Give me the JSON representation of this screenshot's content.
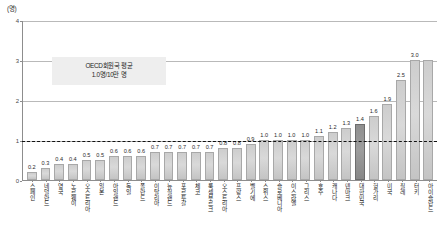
{
  "chart_data": {
    "type": "bar",
    "title": "",
    "unit_label": "(명)",
    "ylabel": "",
    "xlabel": "",
    "ylim": [
      0,
      4
    ],
    "yticks": [
      0,
      1,
      2,
      3,
      4
    ],
    "grid": true,
    "legend": "none",
    "highlight_category": "대한민국",
    "reference_line": {
      "value": 1.0,
      "style": "dashed",
      "label_line1": "OECD회원국 평균",
      "label_line2": "1.0명/10만 명"
    },
    "categories": [
      "스페인",
      "네덜란드",
      "영국",
      "노르웨이",
      "오스트리아",
      "일본",
      "아일랜드",
      "독일",
      "폴란드",
      "이탈리아",
      "뉴질랜드",
      "포르투갈",
      "체코",
      "룩셈부르크",
      "오스트리아",
      "프랑스",
      "벨기에",
      "스위스",
      "슬로베니아",
      "이스라엘",
      "그리스",
      "호주",
      "캐나다",
      "덴마크",
      "대한민국",
      "헝가리",
      "미국",
      "칠레",
      "터키",
      "아이슬란드"
    ],
    "values": [
      0.2,
      0.3,
      0.4,
      0.4,
      0.5,
      0.5,
      0.6,
      0.6,
      0.6,
      0.7,
      0.7,
      0.7,
      0.7,
      0.7,
      0.8,
      0.8,
      0.9,
      1.0,
      1.0,
      1.0,
      1.0,
      1.1,
      1.2,
      1.3,
      1.4,
      1.6,
      1.9,
      2.5,
      3.0,
      3.0
    ],
    "value_labels": [
      "0.2",
      "0.3",
      "0.4",
      "0.4",
      "0.5",
      "0.5",
      "0.6",
      "0.6",
      "0.6",
      "0.7",
      "0.7",
      "0.7",
      "0.7",
      "0.7",
      "0.8",
      "0.8",
      "0.9",
      "1.0",
      "1.0",
      "1.0",
      "1.0",
      "1.1",
      "1.2",
      "1.3",
      "1.4",
      "1.6",
      "1.9",
      "2.5",
      "3.0",
      ""
    ]
  }
}
